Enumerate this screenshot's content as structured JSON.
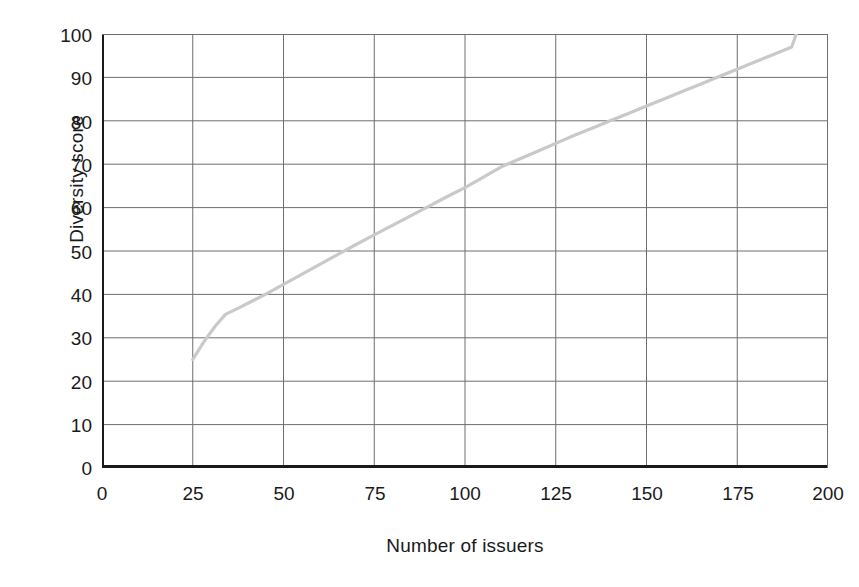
{
  "chart_data": {
    "type": "line",
    "title": "",
    "xlabel": "Number of issuers",
    "ylabel": "Diversity score",
    "xlim": [
      0,
      200
    ],
    "ylim": [
      0,
      100
    ],
    "xticks": [
      0,
      25,
      50,
      75,
      100,
      125,
      150,
      175,
      200
    ],
    "yticks": [
      0,
      10,
      20,
      30,
      40,
      50,
      60,
      70,
      80,
      90,
      100
    ],
    "grid": true,
    "legend": null,
    "series": [
      {
        "name": "Diversity score",
        "color": "#c9c9c9",
        "x": [
          25,
          28,
          31,
          34,
          36,
          38,
          41,
          45,
          50,
          55,
          60,
          65,
          70,
          75,
          80,
          85,
          90,
          95,
          100,
          104,
          110,
          115,
          120,
          125,
          130,
          135,
          140,
          145,
          150,
          155,
          160,
          165,
          170,
          175,
          180,
          185,
          190,
          192
        ],
        "y": [
          25.0,
          29.0,
          32.5,
          35.4,
          36.2,
          37.0,
          38.3,
          40.0,
          42.3,
          44.6,
          46.9,
          49.2,
          51.5,
          53.7,
          55.9,
          58.1,
          60.3,
          62.5,
          64.6,
          66.5,
          69.4,
          71.2,
          73.0,
          74.8,
          76.6,
          78.3,
          80.0,
          81.7,
          83.4,
          85.1,
          86.8,
          88.5,
          90.2,
          91.9,
          93.6,
          95.3,
          97.0,
          101.8
        ]
      }
    ]
  },
  "axes": {
    "y_title": "Diversity score",
    "x_title": "Number of issuers",
    "y_tick_labels": [
      "100",
      "90",
      "80",
      "70",
      "60",
      "50",
      "40",
      "30",
      "20",
      "10",
      "0"
    ],
    "x_tick_labels": [
      "0",
      "25",
      "50",
      "75",
      "100",
      "125",
      "150",
      "175",
      "200"
    ]
  },
  "colors": {
    "axis": "#1a1a1a",
    "grid": "#6e6e6e",
    "series": "#c9c9c9",
    "background": "#ffffff"
  }
}
